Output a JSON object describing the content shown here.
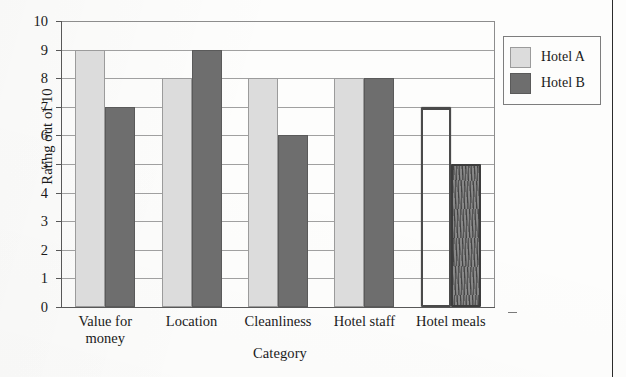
{
  "chart_data": {
    "type": "bar",
    "title": "",
    "subtitle": "",
    "xlabel": "Category",
    "ylabel": "Rating out of 10",
    "categories": [
      "Value for money",
      "Location",
      "Cleanliness",
      "Hotel staff",
      "Hotel meals"
    ],
    "series": [
      {
        "name": "Hotel A",
        "values": [
          9,
          8,
          8,
          8,
          7
        ],
        "color": "#dcdcdc"
      },
      {
        "name": "Hotel B",
        "values": [
          7,
          9,
          6,
          8,
          5
        ],
        "color": "#6e6e6e"
      }
    ],
    "ylim": [
      0,
      10
    ],
    "ytick_labels": [
      "10",
      "9",
      "8",
      "7",
      "6",
      "5",
      "4",
      "3",
      "2",
      "1",
      "0"
    ],
    "ytick_values": [
      10,
      9,
      8,
      7,
      6,
      5,
      4,
      3,
      2,
      1,
      0
    ],
    "grid": true,
    "legend_position": "top-right",
    "annotations": [
      "Final category 'Hotel meals' bars are drawn by hand in pencil: Hotel A is an unfilled outline at 7, Hotel B is a shaded bar at 5."
    ]
  },
  "legend": {
    "entries": [
      {
        "label": "Hotel A",
        "swatch": "light"
      },
      {
        "label": "Hotel B",
        "swatch": "dark"
      }
    ]
  },
  "axes": {
    "y_title": "Rating out of 10",
    "x_title": "Category"
  },
  "category_labels": [
    "Value for\nmoney",
    "Location",
    "Cleanliness",
    "Hotel staff",
    "Hotel meals"
  ]
}
